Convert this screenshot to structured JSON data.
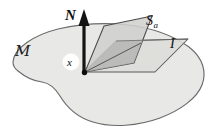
{
  "figure": {
    "type": "geometric-diagram",
    "width": 217,
    "height": 129,
    "background_color": "#ffffff"
  },
  "labels": {
    "normal_vector": "N",
    "plane_sa_symbol": "S",
    "plane_sa_subscript": "a",
    "plane_i": "I",
    "point": "x",
    "manifold": "M"
  },
  "colors": {
    "manifold_fill": "#e8e8e6",
    "manifold_stroke": "#6b6b6b",
    "plane_i_fill": "#dcdcda",
    "plane_i_stroke": "#5a5a5a",
    "plane_sa_fill": "#cfcfcd",
    "plane_sa_stroke": "#4a4a4a",
    "overlap_fill": "#b8b8b6",
    "arrow_color": "#141414",
    "point_color": "#0d0d0d",
    "text_color": "#0f0f0f"
  },
  "geometry": {
    "origin_point": {
      "x": 84,
      "y": 72
    },
    "normal_arrow": {
      "x": 84,
      "y_tip": 11,
      "y_base": 72,
      "shaft_width": 3.2,
      "head_width": 11,
      "head_height": 15
    },
    "manifold_outline_note": "irregular closed blob with concave notch at lower-left",
    "plane_i_corners": "parallelogram from origin extending right and back",
    "plane_sa_corners": "tilted parallelogram standing up through the origin"
  },
  "label_positions": {
    "normal_vector": {
      "x": 69,
      "y": 18
    },
    "plane_sa": {
      "x": 148,
      "y": 24
    },
    "plane_i": {
      "x": 171,
      "y": 44
    },
    "point": {
      "x": 70,
      "y": 66
    },
    "manifold": {
      "x": 17,
      "y": 51
    }
  }
}
